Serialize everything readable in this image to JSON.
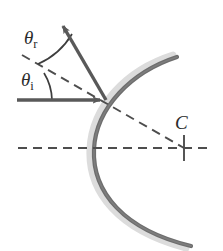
{
  "figure": {
    "type": "ray-diagram",
    "width": 223,
    "height": 251,
    "background_color": "#ffffff"
  },
  "colors": {
    "ray": "#595959",
    "mirror": "#6b6b6b",
    "mirror_shadow": "#d6d6d6",
    "dashed": "#4d4d4d",
    "label": "#2b2b2b"
  },
  "labels": {
    "theta_r": {
      "symbol": "θ",
      "subscript": "r",
      "text": "θr",
      "meaning": "angle-of-reflection"
    },
    "theta_i": {
      "symbol": "θ",
      "subscript": "i",
      "text": "θi",
      "meaning": "angle-of-incidence"
    },
    "center": {
      "text": "C",
      "meaning": "center-of-curvature"
    }
  },
  "elements": {
    "mirror_arc": {
      "name": "concave-mirror-arc",
      "vertex": [
        92,
        148
      ],
      "top_end": [
        177,
        57
      ],
      "bottom_end": [
        191,
        246
      ],
      "opens": "right"
    },
    "incident_ray": {
      "name": "incident-ray",
      "from": [
        17,
        100
      ],
      "to": [
        106,
        100
      ],
      "arrow": true,
      "style": "solid"
    },
    "reflected_ray": {
      "name": "reflected-ray",
      "from": [
        106,
        100
      ],
      "to": [
        59,
        19
      ],
      "arrow": true,
      "style": "solid"
    },
    "normal_line": {
      "name": "normal-line",
      "from": [
        22,
        55
      ],
      "to": [
        184,
        148
      ],
      "style": "dashed",
      "passes_through": [
        106,
        100
      ]
    },
    "optical_axis": {
      "name": "optical-axis",
      "from": [
        18,
        148
      ],
      "to": [
        211,
        148
      ],
      "style": "dashed"
    },
    "center_tick": {
      "name": "center-of-curvature-tick",
      "at": [
        184,
        148
      ],
      "length": 26
    },
    "angle_arc_incidence": {
      "name": "angle-arc-incidence",
      "center": [
        106,
        100
      ],
      "radius": 72
    },
    "angle_arc_reflection": {
      "name": "angle-arc-reflection",
      "center": [
        106,
        100
      ],
      "radius": 56
    }
  }
}
